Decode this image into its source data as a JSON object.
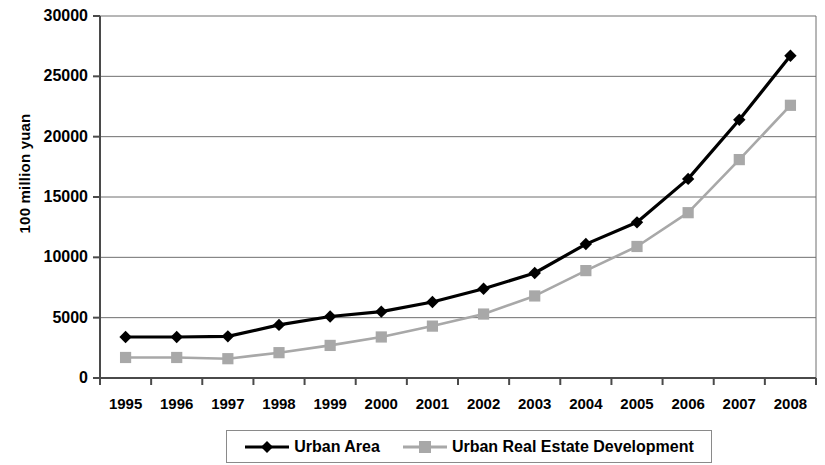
{
  "chart_data": {
    "type": "line",
    "title": "",
    "xlabel": "",
    "ylabel": "100 million yuan",
    "categories": [
      "1995",
      "1996",
      "1997",
      "1998",
      "1999",
      "2000",
      "2001",
      "2002",
      "2003",
      "2004",
      "2005",
      "2006",
      "2007",
      "2008"
    ],
    "ylim": [
      0,
      30000
    ],
    "ytick_step": 5000,
    "yticks": [
      "0",
      "5000",
      "10000",
      "15000",
      "20000",
      "25000",
      "30000"
    ],
    "grid": "horizontal",
    "legend_position": "bottom",
    "series": [
      {
        "name": "Urban Area",
        "color": "#000000",
        "marker": "diamond",
        "values": [
          3400,
          3400,
          3450,
          4400,
          5100,
          5500,
          6300,
          7400,
          8700,
          11100,
          12900,
          16500,
          21400,
          26700
        ]
      },
      {
        "name": "Urban Real Estate Development",
        "color": "#a8a8a8",
        "marker": "square",
        "values": [
          1700,
          1700,
          1600,
          2100,
          2700,
          3400,
          4300,
          5300,
          6800,
          8900,
          10900,
          13700,
          18100,
          22600
        ]
      }
    ]
  },
  "legend": {
    "items": [
      {
        "label": "Urban Area"
      },
      {
        "label": "Urban Real Estate Development"
      }
    ]
  },
  "axes": {
    "y_title": "100 million yuan"
  }
}
